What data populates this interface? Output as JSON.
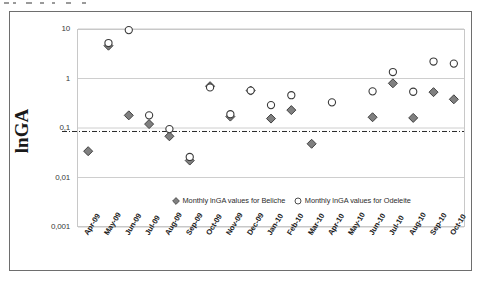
{
  "chart_data": {
    "type": "scatter",
    "title": "",
    "xlabel": "",
    "ylabel": "lnGA",
    "yscale": "log",
    "ylim": [
      0.001,
      10
    ],
    "ytick_labels": [
      "10",
      "1",
      "0,1",
      "0,01",
      "0,001"
    ],
    "ytick_values": [
      10,
      1,
      0.1,
      0.01,
      0.001
    ],
    "grid": "horizontal",
    "legend_position": "inside-bottom-center",
    "categories": [
      "Apr-09",
      "May-09",
      "Jun-09",
      "Jul-09",
      "Aug-09",
      "Sep-09",
      "Oct-09",
      "Nov-09",
      "Dec-09",
      "Jan-10",
      "Feb-10",
      "Mar-10",
      "Apr-10",
      "May-10",
      "Jun-10",
      "Jul-10",
      "Aug-10",
      "Sep-10",
      "Oct-10"
    ],
    "threshold_line": 0.085,
    "series": [
      {
        "name": "Monthly lnGA values for Beliche",
        "marker": "filled-diamond",
        "color": "#808080",
        "edge_color": "#404040",
        "values": [
          0.034,
          4.6,
          0.18,
          0.12,
          0.068,
          0.022,
          0.7,
          0.17,
          0.57,
          0.155,
          0.23,
          0.048,
          null,
          null,
          0.165,
          0.8,
          0.16,
          0.53,
          0.38
        ]
      },
      {
        "name": "Monthly lnGA values for Odeleite",
        "marker": "open-circle",
        "color": "#ffffff",
        "edge_color": "#3a3a3a",
        "values": [
          null,
          5.2,
          9.5,
          0.18,
          0.095,
          0.026,
          0.66,
          0.19,
          0.57,
          0.29,
          0.46,
          null,
          0.33,
          null,
          0.55,
          1.35,
          0.54,
          2.2,
          2.0
        ]
      }
    ]
  },
  "legend": {
    "beliche_label": "Monthly lnGA values for Beliche",
    "odeleite_label": "Monthly lnGA values for Odeleite"
  },
  "axes": {
    "y_title": "lnGA"
  },
  "colors": {
    "beliche_fill": "#808080",
    "beliche_edge": "#404040",
    "odeleite_fill": "#ffffff",
    "odeleite_edge": "#3a3a3a",
    "frame": "#6e6e6e",
    "gridline": "#c8c8c8"
  }
}
